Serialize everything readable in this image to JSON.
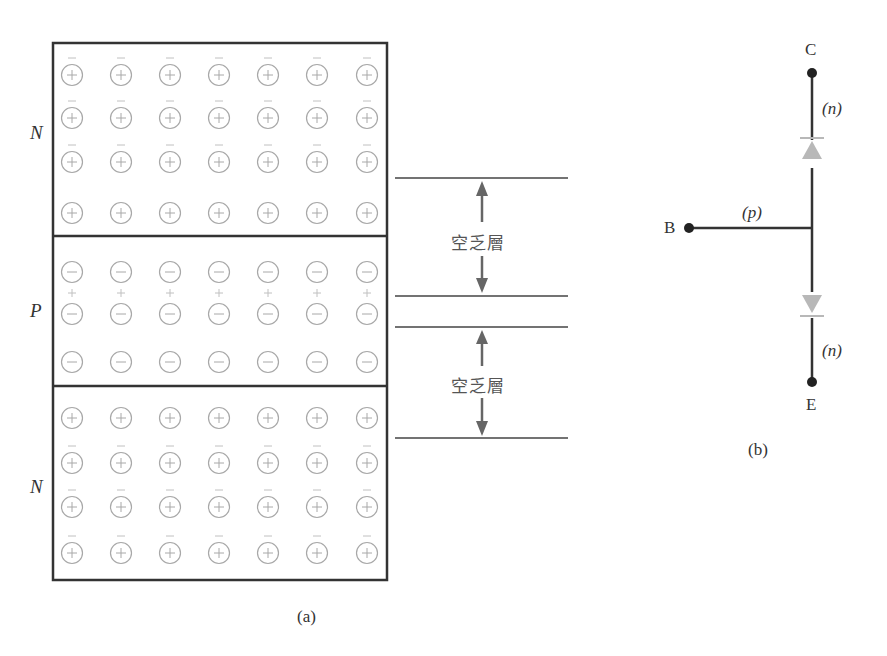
{
  "figure_a": {
    "caption": "(a)",
    "regions": [
      {
        "id": "top",
        "label": "N",
        "type": "n",
        "ion_sign": "+",
        "rows": 4,
        "cols": 7,
        "carrier_sign": "−",
        "carrier_rows_above": [
          0,
          1,
          2
        ]
      },
      {
        "id": "middle",
        "label": "P",
        "type": "p",
        "ion_sign": "−",
        "rows": 3,
        "cols": 7,
        "carrier_sign": "+",
        "carrier_rows_above": [
          1
        ]
      },
      {
        "id": "bottom",
        "label": "N",
        "type": "n",
        "ion_sign": "+",
        "rows": 4,
        "cols": 7,
        "carrier_sign": "−",
        "carrier_rows_above": [
          1,
          2,
          3
        ]
      }
    ],
    "depletion_layers": [
      {
        "label": "空乏層"
      },
      {
        "label": "空乏層"
      }
    ]
  },
  "figure_b": {
    "caption": "(b)",
    "terminals": {
      "collector": "C",
      "base": "B",
      "emitter": "E"
    },
    "region_labels": {
      "collector": "(n)",
      "base": "(p)",
      "emitter": "(n)"
    },
    "colors": {
      "wire": "#333333",
      "diode": "#b8b8b8",
      "terminal_dot": "#222222"
    }
  },
  "colors": {
    "box_border": "#333333",
    "ion_circle": "#a8a8a8",
    "sign": "#a8a8a8",
    "carrier": "#c0c0c0",
    "depletion_line": "#444444",
    "arrow": "#666666"
  }
}
